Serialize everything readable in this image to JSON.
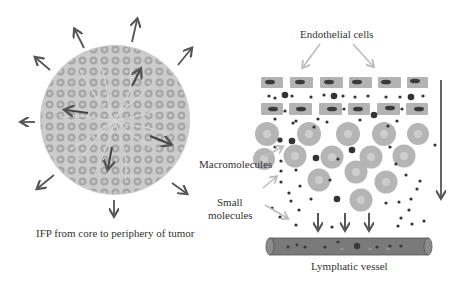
{
  "left_panel": {
    "caption": "IFP from core to periphery of tumor",
    "tumor_color": "#c8c8c8",
    "cell_color": "#a6a6a6",
    "arrow_color": "#555555"
  },
  "right_panel": {
    "labels": {
      "endothelial": "Endothelial cells",
      "macromolecules": "Macromolecules",
      "small_line1": "Small",
      "small_line2": "molecules",
      "vessel": "Lymphatic vessel"
    },
    "colors": {
      "endothelial_cell": "#b3b3b3",
      "nucleus": "#3a3a3a",
      "macromolecule": "#b5b5b5",
      "macromolecule_core": "#cfcfcf",
      "small_molecule": "#333333",
      "vessel": "#7a7a7a",
      "label_arrow": "#bbbbbb"
    }
  }
}
